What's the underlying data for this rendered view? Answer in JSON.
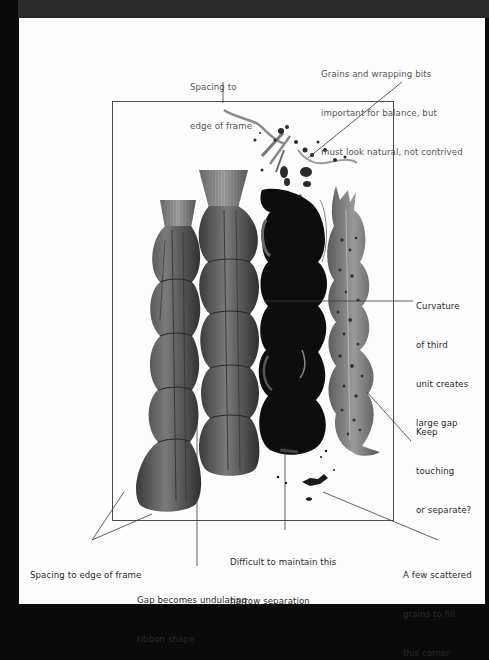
{
  "figure": {
    "type": "annotated composition study",
    "frame_color": "#4a4a4a",
    "line_color": "#3a3a3a",
    "subjects": [
      {
        "id": "bundle-1",
        "description": "wrapped bundle, short, four tied segments",
        "tone": "#5a5a5a"
      },
      {
        "id": "bundle-2",
        "description": "wrapped bundle, tall with flared top, four tied segments",
        "tone": "#5c5c5c"
      },
      {
        "id": "bundle-3",
        "description": "dark bundle, five curved segments",
        "tone": "#0c0c0c"
      },
      {
        "id": "bundle-4",
        "description": "speckled bundle, segmented, tapering",
        "tone": "#777777"
      }
    ]
  },
  "annotations": {
    "spacing_top": [
      "Spacing to",
      "edge of frame"
    ],
    "grains": [
      "Grains and wrapping bits",
      "important for balance, but",
      "must look natural, not contrived"
    ],
    "curvature": [
      "Curvature",
      "of third",
      "unit creates",
      "large gap"
    ],
    "keep_touching": [
      "Keep",
      "touching",
      "or separate?"
    ],
    "spacing_bottom": [
      "Spacing to edge of frame"
    ],
    "gap_ribbon": [
      "Gap becomes undulating",
      "ribbon shape"
    ],
    "difficult": [
      "Difficult to maintain this",
      "narrow separation"
    ],
    "scattered": [
      "A few scattered",
      "grains to fill",
      "this corner"
    ]
  }
}
